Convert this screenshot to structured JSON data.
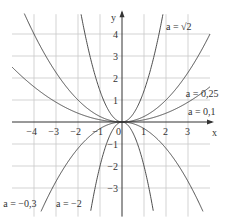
{
  "chart_data": {
    "type": "line",
    "title": "",
    "xlabel": "x",
    "ylabel": "y",
    "function_form": "y = a·x²",
    "xlim": [
      -5,
      4
    ],
    "ylim": [
      -4.3,
      4.9
    ],
    "grid": true,
    "x_ticks": [
      -4,
      -3,
      -2,
      -1,
      0,
      1,
      2,
      3
    ],
    "y_ticks": [
      -3,
      -2,
      -1,
      1,
      2,
      3,
      4
    ],
    "x_tick_labels": [
      "−4",
      "−3",
      "−2",
      "−1",
      "0",
      "1",
      "2",
      "3"
    ],
    "y_tick_labels": [
      "−3",
      "−2",
      "−1",
      "1",
      "2",
      "3",
      "4"
    ],
    "series": [
      {
        "name": "a = √2",
        "a": 1.4142,
        "label": {
          "text": "a = √2",
          "x": 2.0,
          "y": 4.2
        }
      },
      {
        "name": "a = 0,25",
        "a": 0.25,
        "label": {
          "text": "a = 0,25",
          "x": 2.9,
          "y": 1.15
        }
      },
      {
        "name": "a = 0,1",
        "a": 0.1,
        "label": {
          "text": "a = 0,1",
          "x": 3.0,
          "y": 0.3
        }
      },
      {
        "name": "a = −0,3",
        "a": -0.3,
        "label": {
          "text": "a = −0,3",
          "x": -5.4,
          "y": -3.85
        }
      },
      {
        "name": "a = −2",
        "a": -2,
        "label": {
          "text": "a = −2",
          "x": -3.0,
          "y": -3.85
        }
      }
    ]
  }
}
